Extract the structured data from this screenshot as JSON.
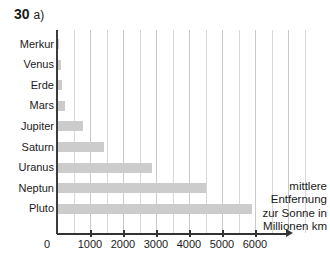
{
  "header": {
    "number": "30",
    "part": "a)"
  },
  "legend": {
    "lines": [
      "mittlere",
      "Entfernung",
      "zur Sonne in",
      "Millionen km"
    ]
  },
  "axis": {
    "zero_label": "0",
    "tick_labels": [
      "1000",
      "2000",
      "3000",
      "4000",
      "5000",
      "6000"
    ]
  },
  "colors": {
    "bar": "#cccccc",
    "grid": "#d8d8d8",
    "axis": "#333333"
  },
  "chart_data": {
    "type": "bar",
    "orientation": "horizontal",
    "xlabel": "mittlere Entfernung zur Sonne in Millionen km",
    "ylabel": "",
    "categories": [
      "Merkur",
      "Venus",
      "Erde",
      "Mars",
      "Jupiter",
      "Saturn",
      "Uranus",
      "Neptun",
      "Pluto"
    ],
    "values": [
      58,
      108,
      150,
      228,
      778,
      1430,
      2870,
      4500,
      5900
    ],
    "xlim": [
      0,
      7000
    ],
    "xticks": [
      0,
      1000,
      2000,
      3000,
      4000,
      5000,
      6000
    ],
    "grid": true,
    "grid_step": 500,
    "legend_position": "none",
    "unit": "Millionen km"
  }
}
